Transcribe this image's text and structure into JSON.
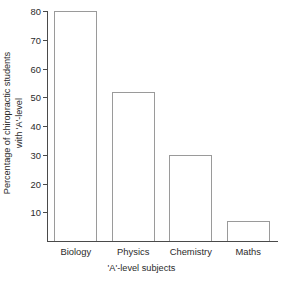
{
  "chart_data": {
    "type": "bar",
    "title": "",
    "subtitle": "",
    "categories": [
      "Biology",
      "Physics",
      "Chemistry",
      "Maths"
    ],
    "values": [
      80,
      52,
      30,
      7
    ],
    "xlabel": "'A'-level subjects",
    "ylabel_line1": "Percentage of chiropractic students",
    "ylabel_line2": "with 'A'-level",
    "ylim": [
      0,
      80
    ],
    "yticks": [
      10,
      20,
      30,
      40,
      50,
      60,
      70,
      80
    ],
    "ytick_labels": [
      "10",
      "20",
      "30",
      "40",
      "50",
      "60",
      "70",
      "80"
    ],
    "grid": false,
    "legend": false,
    "legend_position": "none",
    "bar_fill": "#ffffff",
    "bar_edge": "#9a9a9a",
    "axis_color": "#4a4a4a",
    "text_color": "#2b2b2b",
    "background": "#ffffff"
  }
}
